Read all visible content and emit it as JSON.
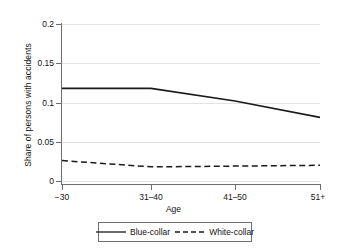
{
  "chart_data": {
    "type": "line",
    "title": "",
    "xlabel": "Age",
    "ylabel": "Share of persons with accidents",
    "categories": [
      "−30",
      "31–40",
      "41–50",
      "51+"
    ],
    "yticks": [
      "0",
      "0.05",
      "0.1",
      "0.15",
      "0.2"
    ],
    "ytick_values": [
      0,
      0.05,
      0.1,
      0.15,
      0.2
    ],
    "ylim": [
      0,
      0.2
    ],
    "grid": "horizontal",
    "legend_position": "bottom",
    "series": [
      {
        "name": "Blue-collar",
        "style": "solid",
        "color": "#1a1a1a",
        "values": [
          0.118,
          0.118,
          0.102,
          0.081
        ]
      },
      {
        "name": "White-collar",
        "style": "dashed",
        "color": "#1a1a1a",
        "values": [
          0.026,
          0.018,
          0.019,
          0.02
        ]
      }
    ]
  },
  "axis": {
    "ytick_0": "0",
    "ytick_1": "0.05",
    "ytick_2": "0.1",
    "ytick_3": "0.15",
    "ytick_4": "0.2",
    "xtick_0": "−30",
    "xtick_1": "31–40",
    "xtick_2": "41–50",
    "xtick_3": "51+",
    "xtitle": "Age",
    "ytitle": "Share of persons with accidents"
  },
  "legend": {
    "item_0": "Blue-collar",
    "item_1": "White-collar"
  }
}
